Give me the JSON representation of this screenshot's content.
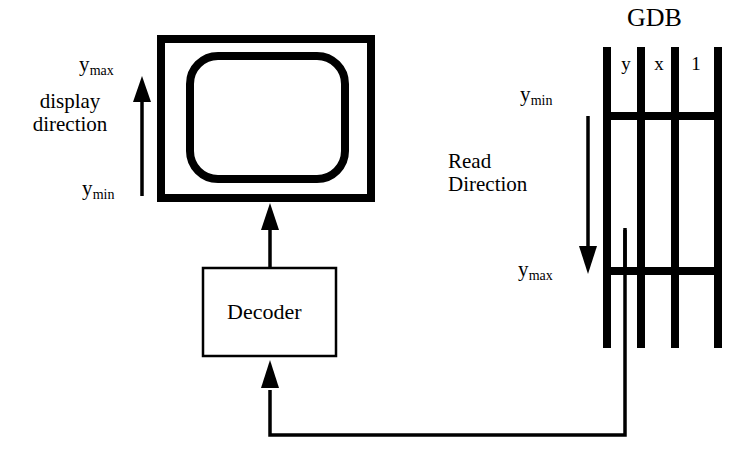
{
  "figure": {
    "title": "GDB",
    "display": {
      "direction_label": "display\ndirection",
      "direction_line1": "display",
      "direction_line2": "direction",
      "top_label_base": "y",
      "top_label_sub": "max",
      "bottom_label_base": "y",
      "bottom_label_sub": "min"
    },
    "read": {
      "direction_line1": "Read",
      "direction_line2": "Direction",
      "top_label_base": "y",
      "top_label_sub": "min",
      "bottom_label_base": "y",
      "bottom_label_sub": "max"
    },
    "decoder": {
      "label": "Decoder"
    },
    "table": {
      "name": "GDB",
      "columns": [
        "y",
        "x",
        "1"
      ]
    },
    "colors": {
      "ink": "#000000",
      "background": "#ffffff"
    },
    "icons": {
      "display_arrow": "arrow-up-icon",
      "read_arrow": "arrow-down-icon",
      "decoder_out_arrow": "arrow-up-icon",
      "decoder_in_arrow": "arrow-up-icon"
    }
  }
}
